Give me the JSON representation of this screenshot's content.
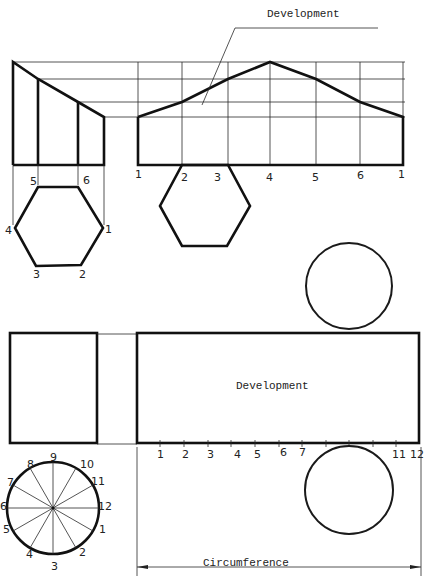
{
  "top_figure": {
    "name": "Truncated hexagonal prism",
    "development_label": "Development",
    "front_view_grid_labels": [
      "5",
      "6"
    ],
    "top_view_hexagon_labels": [
      "1",
      "2",
      "3",
      "4",
      "5",
      "6"
    ],
    "development_baseline_labels": [
      "1",
      "2",
      "3",
      "4",
      "5",
      "6",
      "1"
    ]
  },
  "bottom_figure": {
    "name": "Cylinder",
    "development_label": "Development",
    "circle_division_labels": [
      "1",
      "2",
      "3",
      "4",
      "5",
      "6",
      "7",
      "8",
      "9",
      "10",
      "11",
      "12"
    ],
    "development_baseline_labels": [
      "1",
      "2",
      "3",
      "4",
      "5",
      "6",
      "7",
      "11",
      "12"
    ],
    "dimension_label": "Circumference"
  }
}
